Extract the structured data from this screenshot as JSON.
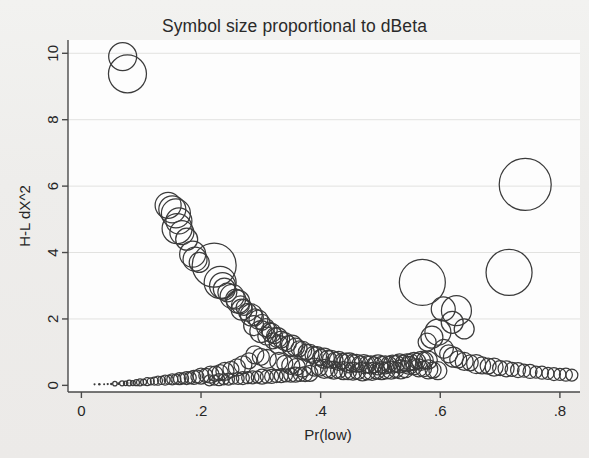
{
  "chart_data": {
    "type": "scatter",
    "title": "Symbol size proportional to dBeta",
    "xlabel": "Pr(low)",
    "ylabel": "H-L dX^2",
    "xlim": [
      -0.0224,
      0.8336
    ],
    "ylim": [
      -0.2,
      10.4
    ],
    "xticks": [
      0,
      0.2,
      0.4,
      0.6,
      0.8
    ],
    "xtick_labels": [
      "0",
      ".2",
      ".4",
      ".6",
      ".8"
    ],
    "yticks": [
      0,
      2,
      4,
      6,
      8,
      10
    ],
    "ytick_labels": [
      "0",
      "2",
      "4",
      "6",
      "8",
      "10"
    ],
    "grid": "horizontal",
    "legend": null,
    "size_encoding": "Symbol area proportional to dBeta (influence statistic)",
    "marker": "open-circle",
    "marker_color": "#3b3b3b",
    "points": [
      [
        0.069,
        9.9,
        14.0
      ],
      [
        0.077,
        9.38,
        19.0
      ],
      [
        0.145,
        5.42,
        13.0
      ],
      [
        0.152,
        5.3,
        13.5
      ],
      [
        0.158,
        5.18,
        14.5
      ],
      [
        0.163,
        4.95,
        13.0
      ],
      [
        0.16,
        4.72,
        15.0
      ],
      [
        0.168,
        4.6,
        12.0
      ],
      [
        0.176,
        4.4,
        11.0
      ],
      [
        0.186,
        3.95,
        13.0
      ],
      [
        0.19,
        3.8,
        12.0
      ],
      [
        0.197,
        3.7,
        10.0
      ],
      [
        0.222,
        3.62,
        22.0
      ],
      [
        0.232,
        3.1,
        16.0
      ],
      [
        0.236,
        3.0,
        13.0
      ],
      [
        0.239,
        2.9,
        11.0
      ],
      [
        0.244,
        2.8,
        9.5
      ],
      [
        0.252,
        2.68,
        12.0
      ],
      [
        0.258,
        2.6,
        10.0
      ],
      [
        0.262,
        2.52,
        11.5
      ],
      [
        0.266,
        2.42,
        9.0
      ],
      [
        0.272,
        2.35,
        8.0
      ],
      [
        0.268,
        2.28,
        10.5
      ],
      [
        0.278,
        2.2,
        9.0
      ],
      [
        0.284,
        2.12,
        11.0
      ],
      [
        0.29,
        2.05,
        8.5
      ],
      [
        0.296,
        1.98,
        9.5
      ],
      [
        0.302,
        1.9,
        8.0
      ],
      [
        0.288,
        1.8,
        10.0
      ],
      [
        0.308,
        1.74,
        9.0
      ],
      [
        0.314,
        1.66,
        8.0
      ],
      [
        0.318,
        1.58,
        9.5
      ],
      [
        0.323,
        1.5,
        8.0
      ],
      [
        0.328,
        1.44,
        10.0
      ],
      [
        0.334,
        1.38,
        8.5
      ],
      [
        0.34,
        1.32,
        9.0
      ],
      [
        0.346,
        1.26,
        8.0
      ],
      [
        0.352,
        1.2,
        10.5
      ],
      [
        0.358,
        1.15,
        9.0
      ],
      [
        0.364,
        1.1,
        8.0
      ],
      [
        0.3,
        1.62,
        11.0
      ],
      [
        0.31,
        1.48,
        9.0
      ],
      [
        0.32,
        1.34,
        8.0
      ],
      [
        0.33,
        1.22,
        9.5
      ],
      [
        0.37,
        1.05,
        9.0
      ],
      [
        0.376,
        1.0,
        8.0
      ],
      [
        0.382,
        0.96,
        9.0
      ],
      [
        0.388,
        0.92,
        8.5
      ],
      [
        0.394,
        0.88,
        9.5
      ],
      [
        0.4,
        0.84,
        8.0
      ],
      [
        0.406,
        0.82,
        10.0
      ],
      [
        0.412,
        0.8,
        8.5
      ],
      [
        0.418,
        0.78,
        9.0
      ],
      [
        0.424,
        0.76,
        8.0
      ],
      [
        0.43,
        0.74,
        9.5
      ],
      [
        0.436,
        0.72,
        8.0
      ],
      [
        0.442,
        0.7,
        9.0
      ],
      [
        0.448,
        0.68,
        10.0
      ],
      [
        0.454,
        0.67,
        8.5
      ],
      [
        0.46,
        0.66,
        9.0
      ],
      [
        0.466,
        0.65,
        8.0
      ],
      [
        0.472,
        0.64,
        9.5
      ],
      [
        0.478,
        0.63,
        8.5
      ],
      [
        0.484,
        0.62,
        9.0
      ],
      [
        0.49,
        0.62,
        8.0
      ],
      [
        0.496,
        0.62,
        10.0
      ],
      [
        0.502,
        0.62,
        8.5
      ],
      [
        0.508,
        0.62,
        9.0
      ],
      [
        0.514,
        0.63,
        8.0
      ],
      [
        0.52,
        0.64,
        9.0
      ],
      [
        0.526,
        0.65,
        8.5
      ],
      [
        0.532,
        0.66,
        9.5
      ],
      [
        0.538,
        0.67,
        8.0
      ],
      [
        0.544,
        0.68,
        9.0
      ],
      [
        0.55,
        0.7,
        8.5
      ],
      [
        0.556,
        0.72,
        9.0
      ],
      [
        0.562,
        0.73,
        8.0
      ],
      [
        0.568,
        0.74,
        9.5
      ],
      [
        0.574,
        0.75,
        8.5
      ],
      [
        0.58,
        0.76,
        9.0
      ],
      [
        0.39,
        0.55,
        9.0
      ],
      [
        0.398,
        0.52,
        8.0
      ],
      [
        0.406,
        0.5,
        9.5
      ],
      [
        0.414,
        0.48,
        8.5
      ],
      [
        0.422,
        0.46,
        9.0
      ],
      [
        0.43,
        0.45,
        8.0
      ],
      [
        0.438,
        0.44,
        9.0
      ],
      [
        0.446,
        0.43,
        8.5
      ],
      [
        0.454,
        0.43,
        9.0
      ],
      [
        0.462,
        0.42,
        8.0
      ],
      [
        0.47,
        0.42,
        9.5
      ],
      [
        0.478,
        0.42,
        8.5
      ],
      [
        0.486,
        0.42,
        9.0
      ],
      [
        0.494,
        0.43,
        8.0
      ],
      [
        0.502,
        0.44,
        9.0
      ],
      [
        0.51,
        0.45,
        8.5
      ],
      [
        0.518,
        0.46,
        9.0
      ],
      [
        0.526,
        0.47,
        8.0
      ],
      [
        0.534,
        0.48,
        9.5
      ],
      [
        0.542,
        0.49,
        8.5
      ],
      [
        0.33,
        0.72,
        9.0
      ],
      [
        0.34,
        0.66,
        8.0
      ],
      [
        0.35,
        0.6,
        9.0
      ],
      [
        0.36,
        0.56,
        8.5
      ],
      [
        0.37,
        0.52,
        9.0
      ],
      [
        0.31,
        0.8,
        9.5
      ],
      [
        0.3,
        0.86,
        8.5
      ],
      [
        0.29,
        0.92,
        9.0
      ],
      [
        0.28,
        0.74,
        8.0
      ],
      [
        0.27,
        0.62,
        9.0
      ],
      [
        0.26,
        0.54,
        8.5
      ],
      [
        0.25,
        0.48,
        8.0
      ],
      [
        0.24,
        0.42,
        9.0
      ],
      [
        0.232,
        0.38,
        8.0
      ],
      [
        0.224,
        0.35,
        7.5
      ],
      [
        0.216,
        0.32,
        8.5
      ],
      [
        0.208,
        0.3,
        7.0
      ],
      [
        0.2,
        0.28,
        8.0
      ],
      [
        0.194,
        0.26,
        6.5
      ],
      [
        0.188,
        0.24,
        7.0
      ],
      [
        0.182,
        0.23,
        6.0
      ],
      [
        0.176,
        0.22,
        6.5
      ],
      [
        0.17,
        0.21,
        5.5
      ],
      [
        0.164,
        0.2,
        6.0
      ],
      [
        0.158,
        0.19,
        5.0
      ],
      [
        0.152,
        0.18,
        5.5
      ],
      [
        0.146,
        0.17,
        4.5
      ],
      [
        0.14,
        0.16,
        5.0
      ],
      [
        0.134,
        0.15,
        4.0
      ],
      [
        0.128,
        0.14,
        4.5
      ],
      [
        0.122,
        0.13,
        4.0
      ],
      [
        0.116,
        0.12,
        3.5
      ],
      [
        0.11,
        0.11,
        4.0
      ],
      [
        0.104,
        0.1,
        3.0
      ],
      [
        0.098,
        0.09,
        3.5
      ],
      [
        0.092,
        0.08,
        3.0
      ],
      [
        0.086,
        0.07,
        2.5
      ],
      [
        0.08,
        0.07,
        2.8
      ],
      [
        0.074,
        0.06,
        2.2
      ],
      [
        0.068,
        0.06,
        2.5
      ],
      [
        0.062,
        0.05,
        2.0
      ],
      [
        0.056,
        0.05,
        2.2
      ],
      [
        0.05,
        0.04,
        1.8
      ],
      [
        0.044,
        0.04,
        1.6
      ],
      [
        0.038,
        0.03,
        1.4
      ],
      [
        0.03,
        0.03,
        1.8
      ],
      [
        0.022,
        0.03,
        1.5
      ],
      [
        0.57,
        3.1,
        23.0
      ],
      [
        0.605,
        2.3,
        12.0
      ],
      [
        0.627,
        2.25,
        15.0
      ],
      [
        0.62,
        1.9,
        11.0
      ],
      [
        0.64,
        1.7,
        10.0
      ],
      [
        0.596,
        1.6,
        13.0
      ],
      [
        0.586,
        1.45,
        11.0
      ],
      [
        0.578,
        1.3,
        9.0
      ],
      [
        0.606,
        1.1,
        9.5
      ],
      [
        0.614,
        0.95,
        9.0
      ],
      [
        0.622,
        0.85,
        10.0
      ],
      [
        0.63,
        0.78,
        8.5
      ],
      [
        0.64,
        0.72,
        9.0
      ],
      [
        0.65,
        0.68,
        8.0
      ],
      [
        0.66,
        0.64,
        9.5
      ],
      [
        0.67,
        0.6,
        8.5
      ],
      [
        0.68,
        0.58,
        8.0
      ],
      [
        0.69,
        0.55,
        9.0
      ],
      [
        0.7,
        0.52,
        7.5
      ],
      [
        0.71,
        0.5,
        8.0
      ],
      [
        0.72,
        0.48,
        7.0
      ],
      [
        0.73,
        0.46,
        7.5
      ],
      [
        0.74,
        0.44,
        6.5
      ],
      [
        0.75,
        0.42,
        7.0
      ],
      [
        0.76,
        0.4,
        6.0
      ],
      [
        0.77,
        0.38,
        6.5
      ],
      [
        0.78,
        0.36,
        6.0
      ],
      [
        0.79,
        0.34,
        6.5
      ],
      [
        0.8,
        0.33,
        6.0
      ],
      [
        0.81,
        0.32,
        6.5
      ],
      [
        0.82,
        0.31,
        6.0
      ],
      [
        0.742,
        6.05,
        26.0
      ],
      [
        0.715,
        3.4,
        23.0
      ],
      [
        0.548,
        0.6,
        9.0
      ],
      [
        0.556,
        0.56,
        8.0
      ],
      [
        0.564,
        0.53,
        9.0
      ],
      [
        0.572,
        0.5,
        8.0
      ],
      [
        0.58,
        0.48,
        9.5
      ],
      [
        0.588,
        0.46,
        8.0
      ],
      [
        0.596,
        0.44,
        9.0
      ],
      [
        0.382,
        0.36,
        8.0
      ],
      [
        0.374,
        0.34,
        7.5
      ],
      [
        0.366,
        0.33,
        7.0
      ],
      [
        0.358,
        0.32,
        7.5
      ],
      [
        0.35,
        0.31,
        7.0
      ],
      [
        0.342,
        0.3,
        6.5
      ],
      [
        0.334,
        0.29,
        7.0
      ],
      [
        0.326,
        0.28,
        6.5
      ],
      [
        0.318,
        0.27,
        7.0
      ],
      [
        0.31,
        0.26,
        6.5
      ],
      [
        0.302,
        0.26,
        7.5
      ],
      [
        0.294,
        0.25,
        6.0
      ],
      [
        0.286,
        0.24,
        6.5
      ],
      [
        0.278,
        0.23,
        6.0
      ],
      [
        0.27,
        0.22,
        6.5
      ],
      [
        0.262,
        0.21,
        6.0
      ],
      [
        0.254,
        0.2,
        5.5
      ],
      [
        0.246,
        0.19,
        6.0
      ],
      [
        0.238,
        0.18,
        5.5
      ],
      [
        0.23,
        0.17,
        6.0
      ],
      [
        0.222,
        0.16,
        5.0
      ],
      [
        0.214,
        0.15,
        5.5
      ]
    ]
  }
}
